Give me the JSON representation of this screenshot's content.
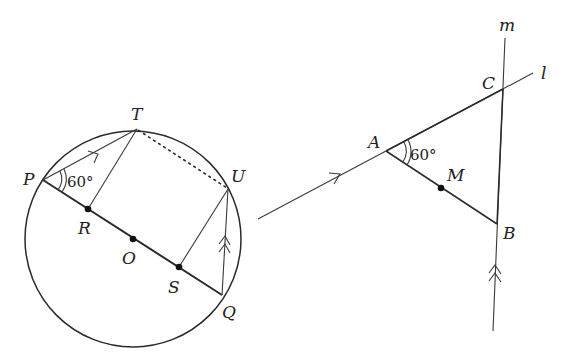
{
  "figure": {
    "left": {
      "name": "circle-figure",
      "circle": {
        "center_label": "O",
        "cx": 133,
        "cy": 239,
        "r": 108
      },
      "points": {
        "P": {
          "label": "P",
          "x": 43,
          "y": 180
        },
        "T": {
          "label": "T",
          "x": 137,
          "y": 129
        },
        "U": {
          "label": "U",
          "x": 228,
          "y": 189
        },
        "Q": {
          "label": "Q",
          "x": 222,
          "y": 295
        },
        "R": {
          "label": "R",
          "x": 88,
          "y": 209
        },
        "O": {
          "label": "O",
          "x": 133,
          "y": 239
        },
        "S": {
          "label": "S",
          "x": 179,
          "y": 267
        }
      },
      "angle_label": "60°",
      "segments": [
        "PQ (diameter)",
        "PT (single arrow)",
        "RT",
        "TU (dashed)",
        "SU",
        "QU (double arrow)"
      ]
    },
    "right": {
      "name": "lines-figure",
      "points": {
        "A": {
          "label": "A",
          "x": 386,
          "y": 151
        },
        "C": {
          "label": "C",
          "x": 503,
          "y": 89
        },
        "B": {
          "label": "B",
          "x": 497,
          "y": 224
        },
        "M": {
          "label": "M",
          "x": 441,
          "y": 188
        }
      },
      "lines": {
        "l": {
          "label": "l"
        },
        "m": {
          "label": "m"
        }
      },
      "angle_label": "60°",
      "segments": [
        "line l (single arrow)",
        "line m (double arrow)",
        "AB with midpoint M"
      ]
    }
  }
}
